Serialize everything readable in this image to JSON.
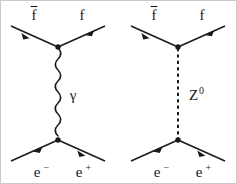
{
  "figure": {
    "background_color": "#ffffff",
    "ink_color": "#1a1a1a",
    "border_color": "#c9c9c9",
    "width": 237,
    "height": 184
  },
  "diagrams": [
    {
      "id": "photon-exchange",
      "name": "s-channel photon exchange",
      "propagator": {
        "kind": "photon",
        "style": "wavy",
        "label": "γ"
      },
      "top_vertex": {
        "left_leg": {
          "label": "f",
          "overbar": true,
          "arrow": "incoming"
        },
        "right_leg": {
          "label": "f",
          "overbar": false,
          "arrow": "outgoing"
        }
      },
      "bottom_vertex": {
        "left_leg": {
          "label": "e",
          "superscript": "−",
          "arrow": "incoming"
        },
        "right_leg": {
          "label": "e",
          "superscript": "+",
          "arrow": "outgoing"
        }
      }
    },
    {
      "id": "z-boson-exchange",
      "name": "s-channel Z boson exchange",
      "propagator": {
        "kind": "z-boson",
        "style": "dashed",
        "label": "Z",
        "label_superscript": "0"
      },
      "top_vertex": {
        "left_leg": {
          "label": "f",
          "overbar": true,
          "arrow": "incoming"
        },
        "right_leg": {
          "label": "f",
          "overbar": false,
          "arrow": "outgoing"
        }
      },
      "bottom_vertex": {
        "left_leg": {
          "label": "e",
          "superscript": "−",
          "arrow": "incoming"
        },
        "right_leg": {
          "label": "e",
          "superscript": "+",
          "arrow": "outgoing"
        }
      }
    }
  ],
  "labels": {
    "fbar_left_photon": "f",
    "f_right_photon": "f",
    "gamma": "γ",
    "electron_photon": "e",
    "electron_sup_photon": "−",
    "positron_photon": "e",
    "positron_sup_photon": "+",
    "fbar_left_z": "f",
    "f_right_z": "f",
    "zboson": "Z",
    "zboson_sup": "0",
    "electron_z": "e",
    "electron_sup_z": "−",
    "positron_z": "e",
    "positron_sup_z": "+"
  }
}
